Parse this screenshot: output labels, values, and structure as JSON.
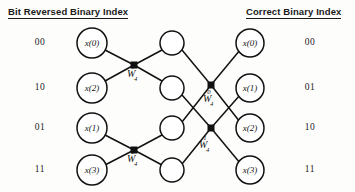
{
  "headers": {
    "left": "Bit Reversed Binary Index",
    "right": "Correct Binary Index"
  },
  "left_indices": [
    "00",
    "10",
    "01",
    "11"
  ],
  "right_indices": [
    "00",
    "01",
    "10",
    "11"
  ],
  "input_nodes": [
    {
      "label": "x(0)",
      "cx": 92,
      "cy": 43,
      "r": 15
    },
    {
      "label": "x(2)",
      "cx": 92,
      "cy": 88,
      "r": 15
    },
    {
      "label": "x(1)",
      "cx": 92,
      "cy": 128,
      "r": 15
    },
    {
      "label": "x(3)",
      "cx": 92,
      "cy": 170,
      "r": 15
    }
  ],
  "middle_nodes": [
    {
      "label": "",
      "cx": 172,
      "cy": 43,
      "r": 12
    },
    {
      "label": "",
      "cx": 172,
      "cy": 88,
      "r": 12
    },
    {
      "label": "",
      "cx": 172,
      "cy": 128,
      "r": 12
    },
    {
      "label": "",
      "cx": 172,
      "cy": 170,
      "r": 12
    }
  ],
  "output_nodes": [
    {
      "label": "x(0)",
      "cx": 250,
      "cy": 43,
      "r": 14
    },
    {
      "label": "x(1)",
      "cx": 250,
      "cy": 88,
      "r": 14
    },
    {
      "label": "x(2)",
      "cx": 250,
      "cy": 128,
      "r": 14
    },
    {
      "label": "x(3)",
      "cx": 250,
      "cy": 170,
      "r": 14
    }
  ],
  "butterfly_nodes": [
    {
      "cx": 134,
      "cy": 65,
      "size": 7
    },
    {
      "cx": 134,
      "cy": 150,
      "size": 7
    },
    {
      "cx": 211,
      "cy": 85,
      "size": 7
    },
    {
      "cx": 211,
      "cy": 128,
      "size": 7
    }
  ],
  "weight_labels": [
    {
      "symbol": "W",
      "sub": "4",
      "sup": "0",
      "x": 127,
      "y": 68
    },
    {
      "symbol": "W",
      "sub": "4",
      "sup": "0",
      "x": 127,
      "y": 153
    },
    {
      "symbol": "W",
      "sub": "4",
      "sup": "0",
      "x": 203,
      "y": 93
    },
    {
      "symbol": "W",
      "sub": "4",
      "sup": "1",
      "x": 199,
      "y": 139
    }
  ],
  "edges": [
    {
      "from": "x(0)",
      "to": "butterfly-1",
      "x1": 105,
      "y1": 50,
      "x2": 134,
      "y2": 65
    },
    {
      "from": "x(2)",
      "to": "butterfly-1",
      "x1": 105,
      "y1": 81,
      "x2": 134,
      "y2": 65
    },
    {
      "from": "butterfly-1",
      "to": "mid-1",
      "x1": 134,
      "y1": 65,
      "x2": 162,
      "y2": 50
    },
    {
      "from": "butterfly-1",
      "to": "mid-2",
      "x1": 134,
      "y1": 65,
      "x2": 162,
      "y2": 81
    },
    {
      "from": "x(1)",
      "to": "butterfly-2",
      "x1": 105,
      "y1": 135,
      "x2": 134,
      "y2": 150
    },
    {
      "from": "x(3)",
      "to": "butterfly-2",
      "x1": 105,
      "y1": 165,
      "x2": 134,
      "y2": 150
    },
    {
      "from": "butterfly-2",
      "to": "mid-3",
      "x1": 134,
      "y1": 150,
      "x2": 162,
      "y2": 135
    },
    {
      "from": "butterfly-2",
      "to": "mid-4",
      "x1": 134,
      "y1": 150,
      "x2": 162,
      "y2": 165
    },
    {
      "from": "mid-1",
      "to": "butterfly-3",
      "x1": 182,
      "y1": 50,
      "x2": 211,
      "y2": 85
    },
    {
      "from": "mid-3",
      "to": "butterfly-3",
      "x1": 182,
      "y1": 122,
      "x2": 211,
      "y2": 85
    },
    {
      "from": "mid-2",
      "to": "butterfly-4",
      "x1": 182,
      "y1": 95,
      "x2": 211,
      "y2": 128
    },
    {
      "from": "mid-4",
      "to": "butterfly-4",
      "x1": 182,
      "y1": 164,
      "x2": 211,
      "y2": 128
    },
    {
      "from": "butterfly-3",
      "to": "x(0)out",
      "x1": 211,
      "y1": 85,
      "x2": 240,
      "y2": 50
    },
    {
      "from": "butterfly-3",
      "to": "x(2)out",
      "x1": 211,
      "y1": 85,
      "x2": 240,
      "y2": 122
    },
    {
      "from": "butterfly-4",
      "to": "x(1)out",
      "x1": 211,
      "y1": 128,
      "x2": 240,
      "y2": 95
    },
    {
      "from": "butterfly-4",
      "to": "x(3)out",
      "x1": 211,
      "y1": 128,
      "x2": 240,
      "y2": 163
    }
  ],
  "colors": {
    "background": "#fdfdfc",
    "ink": "#111111",
    "node_fill": "#ffffff"
  }
}
